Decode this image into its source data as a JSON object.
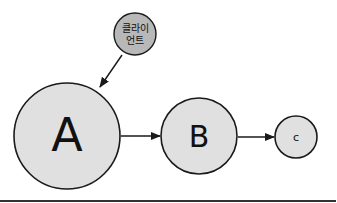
{
  "diagram": {
    "nodes": [
      {
        "id": "client",
        "label_line1": "클라이",
        "label_line2": "언트",
        "fill": "#b8b8b8"
      },
      {
        "id": "A",
        "label": "A",
        "fill": "#e0e0e0"
      },
      {
        "id": "B",
        "label": "B",
        "fill": "#e0e0e0"
      },
      {
        "id": "C",
        "label": "c",
        "fill": "#e0e0e0"
      }
    ],
    "edges": [
      {
        "from": "client",
        "to": "A"
      },
      {
        "from": "A",
        "to": "B"
      },
      {
        "from": "B",
        "to": "C"
      }
    ]
  }
}
